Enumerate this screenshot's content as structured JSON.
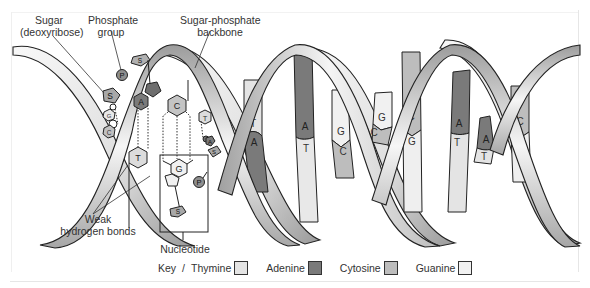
{
  "labels": {
    "sugar_line1": "Sugar",
    "sugar_line2": "(deoxyribose)",
    "phosphate_line1": "Phosphate",
    "phosphate_line2": "group",
    "backbone_line1": "Sugar-phosphate",
    "backbone_line2": "backbone",
    "weak_line1": "Weak",
    "weak_line2": "hydrogen bonds",
    "nucleotide": "Nucleotide"
  },
  "key": {
    "title": "Key",
    "separator": "/",
    "items": [
      {
        "name": "Thymine",
        "color": "#e4e4e4"
      },
      {
        "name": "Adenine",
        "color": "#7a7a7a"
      },
      {
        "name": "Cytosine",
        "color": "#bdbdbd"
      },
      {
        "name": "Guanine",
        "color": "#f1f1f1"
      }
    ]
  },
  "molecule_letters": {
    "sugar": "S",
    "phosphate": "P",
    "adenine": "A",
    "cytosine": "C",
    "thymine": "T",
    "guanine": "G"
  },
  "base_pairs": [
    {
      "top": "T",
      "bottom": "A"
    },
    {
      "top": "A",
      "bottom": "T"
    },
    {
      "top": "G",
      "bottom": "C"
    },
    {
      "top": "G",
      "bottom": "C"
    },
    {
      "top": "C",
      "bottom": "G"
    },
    {
      "top": "A",
      "bottom": "T"
    },
    {
      "top": "A",
      "bottom": "T"
    },
    {
      "top": "C",
      "bottom": "G"
    }
  ],
  "colors": {
    "thymine": "#e4e4e4",
    "adenine": "#7a7a7a",
    "cytosine": "#bdbdbd",
    "guanine": "#f1f1f1",
    "ribbon_dark": "#9a9a9a",
    "ribbon_light": "#f4f4f4",
    "outline": "#222222"
  }
}
